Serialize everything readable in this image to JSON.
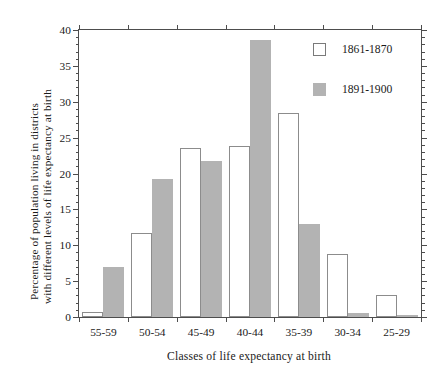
{
  "chart_data": {
    "type": "bar",
    "title": "",
    "xlabel": "Classes of life expectancy at birth",
    "ylabel": "Percentage of population living in districts with different levels of life expectancy at birth",
    "ylabel_line1": "Percentage of population living in districts",
    "ylabel_line2": "with different levels of life expectancy at birth",
    "categories": [
      "55-59",
      "50-54",
      "45-49",
      "40-44",
      "35-39",
      "30-34",
      "25-29"
    ],
    "series": [
      {
        "name": "1861-1870",
        "color": "#ffffff",
        "edge_color": "#8c8c8c",
        "values": [
          0.7,
          11.7,
          23.6,
          23.9,
          28.5,
          8.8,
          3.1
        ]
      },
      {
        "name": "1891-1900",
        "color": "#b3b3b3",
        "edge_color": "#b3b3b3",
        "values": [
          7.0,
          19.3,
          21.7,
          38.6,
          13.0,
          0.6,
          0.3
        ]
      }
    ],
    "ylim": [
      0,
      40
    ],
    "ytick_labels": [
      "0",
      "5",
      "10",
      "15",
      "20",
      "25",
      "30",
      "35",
      "40"
    ],
    "ytick_values": [
      0,
      5,
      10,
      15,
      20,
      25,
      30,
      35,
      40
    ],
    "yminor_step": 1,
    "grid": false,
    "legend_position": "top-right",
    "legend_entries": [
      "1861-1870",
      "1891-1900"
    ],
    "axis_color": "#4d4d4d",
    "background": "#ffffff"
  }
}
